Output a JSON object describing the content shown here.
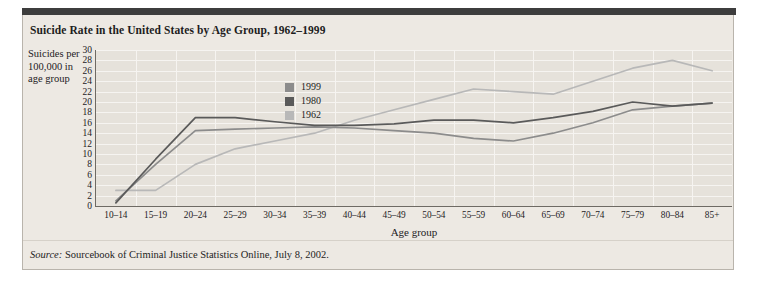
{
  "chart_title": "Suicide Rate in the United States by Age Group, 1962–1999",
  "y_axis_label": "Suicides per 100,000 in age group",
  "source_prefix": "Source:",
  "source_text": " Sourcebook of Criminal Justice Statistics Online, July 8, 2002.",
  "colors": {
    "panel_background": "#ede9e3",
    "plot_background": "#e6e2db",
    "grid": "#f6f4f1",
    "axis": "#6e6a64",
    "top_bar": "#3d3d3d",
    "series_1999": "#8c8c8c",
    "series_1980": "#5a5a5a",
    "series_1962": "#b8b8b8"
  },
  "chart_data": {
    "type": "line",
    "title": "Suicide Rate in the United States by Age Group, 1962–1999",
    "xlabel": "Age group",
    "ylabel": "Suicides per 100,000 in age group",
    "ylim": [
      0,
      30
    ],
    "ytick_step": 2,
    "yticks": [
      0,
      2,
      4,
      6,
      8,
      10,
      12,
      14,
      16,
      18,
      20,
      22,
      24,
      26,
      28,
      30
    ],
    "grid": true,
    "legend_position": "inside-upper-left",
    "categories": [
      "10–14",
      "15–19",
      "20–24",
      "25–29",
      "30–34",
      "35–39",
      "40–44",
      "45–49",
      "50–54",
      "55–59",
      "60–64",
      "65–69",
      "70–74",
      "75–79",
      "80–84",
      "85+"
    ],
    "series": [
      {
        "name": "1999",
        "color": "#8c8c8c",
        "values": [
          1.0,
          8.0,
          14.5,
          14.8,
          15.0,
          15.2,
          15.0,
          14.5,
          14.0,
          13.0,
          12.5,
          14.0,
          16.0,
          18.5,
          19.2,
          19.8
        ]
      },
      {
        "name": "1980",
        "color": "#5a5a5a",
        "values": [
          0.6,
          9.0,
          17.0,
          17.0,
          16.2,
          15.5,
          15.5,
          15.8,
          16.5,
          16.5,
          16.0,
          17.0,
          18.2,
          20.0,
          19.2,
          19.8
        ]
      },
      {
        "name": "1962",
        "color": "#b8b8b8",
        "values": [
          3.0,
          3.0,
          8.0,
          11.0,
          12.5,
          14.0,
          16.5,
          18.5,
          20.5,
          22.5,
          22.0,
          21.5,
          24.0,
          26.5,
          28.0,
          26.0
        ]
      }
    ]
  },
  "legend": [
    {
      "label": "1999",
      "color": "#8c8c8c"
    },
    {
      "label": "1980",
      "color": "#5a5a5a"
    },
    {
      "label": "1962",
      "color": "#b8b8b8"
    }
  ]
}
